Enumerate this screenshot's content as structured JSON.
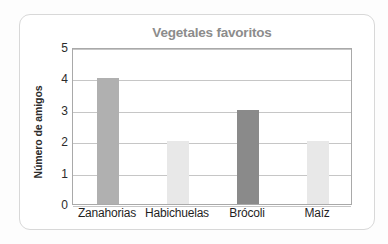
{
  "chart_data": {
    "type": "bar",
    "title": "Vegetales favoritos",
    "xlabel": "",
    "ylabel": "Número de amigos",
    "categories": [
      "Zanahorias",
      "Habichuelas",
      "Brócoli",
      "Maíz"
    ],
    "values": [
      4,
      2,
      3,
      2
    ],
    "ylim": [
      0,
      5
    ],
    "ytick_labels": [
      "0",
      "1",
      "2",
      "3",
      "4",
      "5"
    ],
    "ytick_values": [
      0,
      1,
      2,
      3,
      4,
      5
    ],
    "grid": true,
    "legend": false,
    "bar_colors": [
      "#b0b0b0",
      "#e8e8e8",
      "#8a8a8a",
      "#e8e8e8"
    ],
    "series": [
      {
        "name": "Número de amigos",
        "values": [
          4,
          2,
          3,
          2
        ]
      }
    ]
  },
  "style": {
    "title_color": "#8c8c8c",
    "axis_text_color": "#2b2b2b",
    "grid_color": "#c6c6c6",
    "frame_color": "#a9a9a9",
    "card_border_color": "#d8d8d8",
    "page_background": "#fdfdfd"
  }
}
